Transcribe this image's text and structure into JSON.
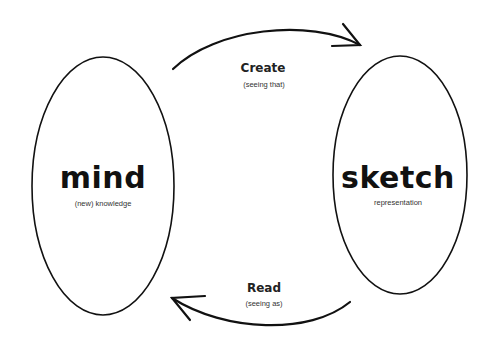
{
  "diagram": {
    "nodes": [
      {
        "id": "mind",
        "title": "mind",
        "subtitle": "(new) knowledge"
      },
      {
        "id": "sketch",
        "title": "sketch",
        "subtitle": "representation"
      }
    ],
    "edges": [
      {
        "from": "mind",
        "to": "sketch",
        "label": "Create",
        "sublabel": "(seeing that)"
      },
      {
        "from": "sketch",
        "to": "mind",
        "label": "Read",
        "sublabel": "(seeing as)"
      }
    ],
    "colors": {
      "stroke": "#111111",
      "background": "#ffffff"
    }
  }
}
